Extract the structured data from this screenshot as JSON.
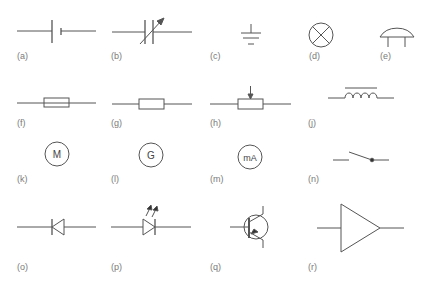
{
  "diagram": {
    "colors": {
      "stroke": "#555555",
      "label": "#7a7a7a",
      "background": "#ffffff"
    },
    "symbols": [
      {
        "id": "a",
        "label": "(a)",
        "name": "cell"
      },
      {
        "id": "b",
        "label": "(b)",
        "name": "variable-capacitor"
      },
      {
        "id": "c",
        "label": "(c)",
        "name": "earth"
      },
      {
        "id": "d",
        "label": "(d)",
        "name": "lamp"
      },
      {
        "id": "e",
        "label": "(e)",
        "name": "semiconductor-sensor"
      },
      {
        "id": "f",
        "label": "(f)",
        "name": "fuse"
      },
      {
        "id": "g",
        "label": "(g)",
        "name": "resistor"
      },
      {
        "id": "h",
        "label": "(h)",
        "name": "potentiometer"
      },
      {
        "id": "j",
        "label": "(j)",
        "name": "inductor-with-core"
      },
      {
        "id": "k",
        "label": "(k)",
        "name": "motor",
        "text": "M"
      },
      {
        "id": "l",
        "label": "(l)",
        "name": "generator",
        "text": "G"
      },
      {
        "id": "m",
        "label": "(m)",
        "name": "milliammeter",
        "text": "mA"
      },
      {
        "id": "n",
        "label": "(n)",
        "name": "switch"
      },
      {
        "id": "o",
        "label": "(o)",
        "name": "diode"
      },
      {
        "id": "p",
        "label": "(p)",
        "name": "light-emitting-diode"
      },
      {
        "id": "q",
        "label": "(q)",
        "name": "transistor"
      },
      {
        "id": "r",
        "label": "(r)",
        "name": "amplifier"
      }
    ]
  }
}
